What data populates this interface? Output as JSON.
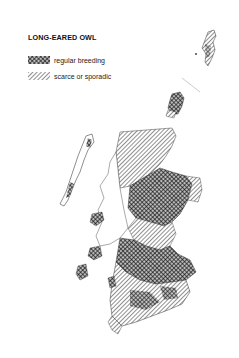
{
  "map": {
    "title": "LONG-EARED OWL",
    "region": "Scotland",
    "legend": [
      {
        "key": "regular",
        "label": "regular breeding",
        "pattern": "cross-hatch",
        "color": "#222222"
      },
      {
        "key": "scarce",
        "label": "scarce or sporadic",
        "pattern": "diagonal-hatch",
        "color": "#555555"
      }
    ]
  }
}
